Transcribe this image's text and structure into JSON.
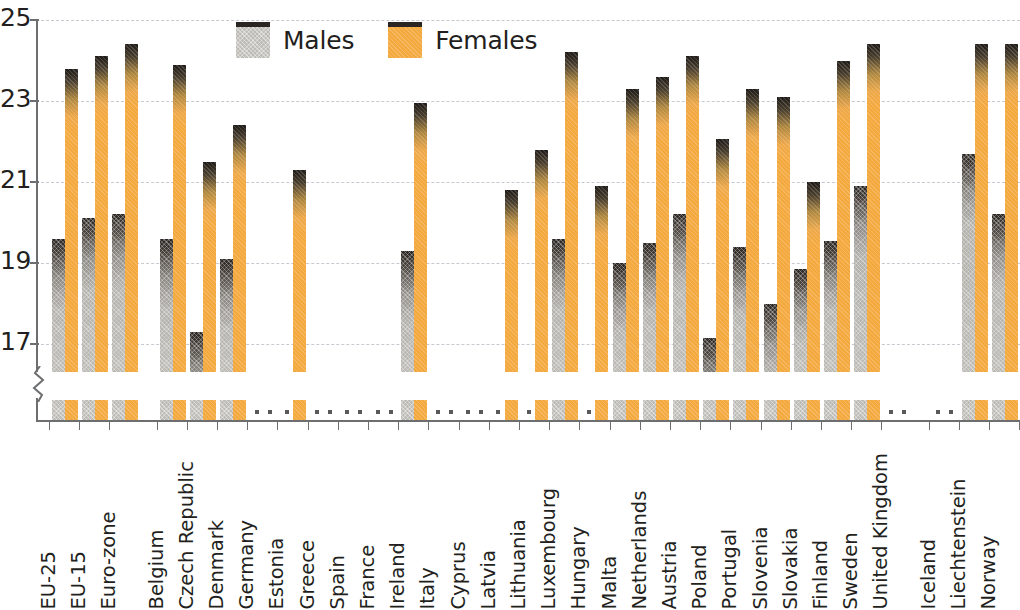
{
  "chart_data": {
    "type": "bar",
    "title": "",
    "subtitle": "",
    "xlabel": "",
    "ylabel": "",
    "ylim": [
      16.2,
      25
    ],
    "y_ticks": [
      25,
      23,
      21,
      19,
      17
    ],
    "y_tick_labels": [
      "25",
      "23",
      "21",
      "19",
      "17"
    ],
    "grid": "horizontal-dashed",
    "axis_break": true,
    "legend_position": "top-center",
    "missing_value_symbol": ":",
    "categories": [
      "EU-25",
      "EU-15",
      "Euro-zone",
      "Belgium",
      "Czech Republic",
      "Denmark",
      "Germany",
      "Estonia",
      "Greece",
      "Spain",
      "France",
      "Ireland",
      "Italy",
      "Cyprus",
      "Latvia",
      "Lithuania",
      "Luxembourg",
      "Hungary",
      "Malta",
      "Netherlands",
      "Austria",
      "Poland",
      "Portugal",
      "Slovenia",
      "Slovakia",
      "Finland",
      "Sweden",
      "United Kingdom",
      "Iceland",
      "Liechtenstein",
      "Norway"
    ],
    "series": [
      {
        "name": "Males",
        "color": "#bdbbb6",
        "values": [
          19.6,
          20.1,
          20.2,
          19.6,
          17.3,
          19.1,
          null,
          null,
          null,
          null,
          null,
          19.3,
          null,
          null,
          null,
          null,
          19.6,
          null,
          19.0,
          19.5,
          20.2,
          17.15,
          19.4,
          18.0,
          18.85,
          19.55,
          20.9,
          null,
          null,
          21.7,
          20.2
        ]
      },
      {
        "name": "Females",
        "color": "#f4a93f",
        "values": [
          23.8,
          24.1,
          24.4,
          23.9,
          21.5,
          22.4,
          null,
          21.3,
          null,
          null,
          null,
          22.95,
          null,
          null,
          20.8,
          21.8,
          24.2,
          20.9,
          23.3,
          23.6,
          24.1,
          22.05,
          23.3,
          23.1,
          21.0,
          24.0,
          24.4,
          null,
          null,
          24.4,
          24.4
        ]
      }
    ],
    "group_breaks_after": [
      "Euro-zone",
      "United Kingdom"
    ]
  },
  "legend": {
    "items": [
      {
        "label": "Males",
        "key": "males"
      },
      {
        "label": "Females",
        "key": "females"
      }
    ]
  }
}
